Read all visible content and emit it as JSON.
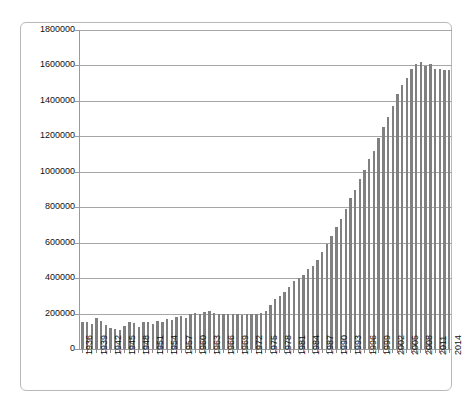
{
  "chart_data": {
    "type": "bar",
    "title": "",
    "xlabel": "",
    "ylabel": "",
    "ylim": [
      0,
      1800000
    ],
    "ytick_step": 200000,
    "grid": true,
    "legend": null,
    "bar_color": "#808080",
    "gridline_color": "#a6a6a6",
    "axis_color": "#9b9b9b",
    "frame_color": "#b9b9b9",
    "background": "#ffffff",
    "xtick_labels_every": 3,
    "ytick_labels": [
      "1800000",
      "1600000",
      "1400000",
      "1200000",
      "1000000",
      "800000",
      "600000",
      "400000",
      "200000",
      "0"
    ],
    "xtick_labels": [
      "1936",
      "1939",
      "1942",
      "1945",
      "1948",
      "1951",
      "1954",
      "1957",
      "1960",
      "1963",
      "1966",
      "1969",
      "1972",
      "1975",
      "1978",
      "1981",
      "1984",
      "1987",
      "1990",
      "1993",
      "1996",
      "1999",
      "2002",
      "2005",
      "2008",
      "2011",
      "2014"
    ],
    "categories": [
      "1936",
      "1937",
      "1938",
      "1939",
      "1940",
      "1941",
      "1942",
      "1943",
      "1944",
      "1945",
      "1946",
      "1947",
      "1948",
      "1949",
      "1950",
      "1951",
      "1952",
      "1953",
      "1954",
      "1955",
      "1956",
      "1957",
      "1958",
      "1959",
      "1960",
      "1961",
      "1962",
      "1963",
      "1964",
      "1965",
      "1966",
      "1967",
      "1968",
      "1969",
      "1970",
      "1971",
      "1972",
      "1973",
      "1974",
      "1975",
      "1976",
      "1977",
      "1978",
      "1979",
      "1980",
      "1981",
      "1982",
      "1983",
      "1984",
      "1985",
      "1986",
      "1987",
      "1988",
      "1989",
      "1990",
      "1991",
      "1992",
      "1993",
      "1994",
      "1995",
      "1996",
      "1997",
      "1998",
      "1999",
      "2000",
      "2001",
      "2002",
      "2003",
      "2004",
      "2005",
      "2006",
      "2007",
      "2008",
      "2009",
      "2010",
      "2011",
      "2012",
      "2013",
      "2014"
    ],
    "values": [
      150000,
      155000,
      140000,
      175000,
      160000,
      135000,
      120000,
      115000,
      110000,
      130000,
      150000,
      145000,
      125000,
      150000,
      155000,
      140000,
      160000,
      155000,
      170000,
      165000,
      180000,
      185000,
      175000,
      195000,
      205000,
      200000,
      210000,
      215000,
      205000,
      200000,
      195000,
      200000,
      195000,
      195000,
      190000,
      195000,
      195000,
      200000,
      205000,
      215000,
      250000,
      280000,
      300000,
      320000,
      350000,
      385000,
      400000,
      420000,
      450000,
      470000,
      500000,
      545000,
      590000,
      640000,
      690000,
      735000,
      790000,
      850000,
      900000,
      960000,
      1010000,
      1070000,
      1120000,
      1190000,
      1250000,
      1310000,
      1370000,
      1440000,
      1490000,
      1530000,
      1580000,
      1610000,
      1620000,
      1595000,
      1610000,
      1580000,
      1580000,
      1575000,
      1575000
    ]
  }
}
